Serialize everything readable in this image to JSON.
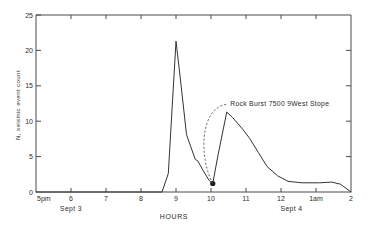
{
  "chart_data": {
    "type": "line",
    "title": "",
    "xlabel": "HOURS",
    "ylabel": "N, seismic event count",
    "xlim": [
      17,
      26
    ],
    "ylim": [
      0,
      25
    ],
    "grid": false,
    "legend": null,
    "x_tick_labels": [
      "5pm",
      "6",
      "7",
      "8",
      "9",
      "10",
      "11",
      "12",
      "1am",
      "2"
    ],
    "x_tick_values": [
      17,
      18,
      19,
      20,
      21,
      22,
      23,
      24,
      25,
      26
    ],
    "y_tick_labels": [
      "0",
      "5",
      "10",
      "15",
      "20",
      "25"
    ],
    "y_tick_values": [
      0,
      5,
      10,
      15,
      20,
      25
    ],
    "date_labels": [
      {
        "text": "Sept 3",
        "x": 18
      },
      {
        "text": "Sept 4",
        "x": 24.3
      }
    ],
    "annotations": [
      {
        "text": "Rock Burst  7500  9West Stope",
        "x": 22.05,
        "y": 1.2,
        "label_x": 22.55,
        "label_y": 12.6
      }
    ],
    "markers": [
      {
        "x": 22.05,
        "y": 1.2,
        "shape": "circle",
        "label": "rock-burst-event"
      }
    ],
    "series": [
      {
        "name": "seismic event count",
        "x": [
          17.0,
          20.45,
          20.6,
          20.78,
          21.0,
          21.12,
          21.3,
          21.55,
          21.62,
          21.78,
          21.95,
          22.05,
          22.2,
          22.45,
          22.62,
          22.9,
          23.1,
          23.35,
          23.6,
          23.9,
          24.2,
          24.6,
          25.1,
          25.45,
          25.7,
          26.0
        ],
        "y": [
          0.0,
          0.0,
          0.0,
          2.6,
          21.3,
          16.2,
          8.1,
          4.6,
          4.4,
          3.0,
          1.6,
          1.2,
          5.2,
          11.3,
          10.5,
          8.9,
          7.6,
          5.6,
          3.6,
          2.3,
          1.5,
          1.3,
          1.3,
          1.4,
          1.1,
          0.0
        ]
      }
    ]
  },
  "colors": {
    "curve": "#333333",
    "axis": "#4a4a4a",
    "text": "#2b2b2b",
    "background": "#ffffff"
  }
}
